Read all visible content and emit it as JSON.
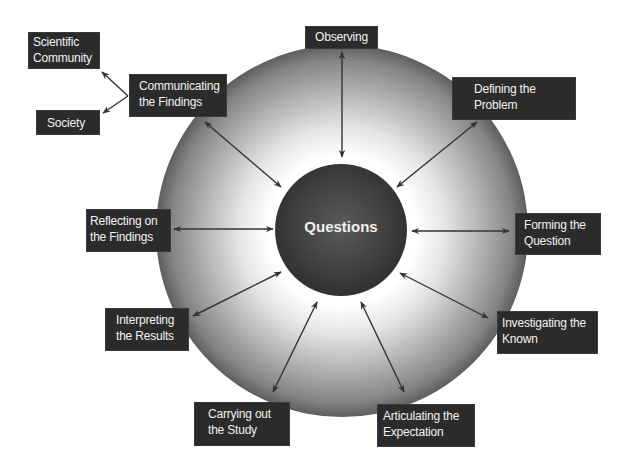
{
  "center": {
    "label": "Questions"
  },
  "nodes": {
    "observing": {
      "line1": "Observing",
      "line2": ""
    },
    "defining": {
      "line1": "Defining the",
      "line2": "Problem"
    },
    "forming": {
      "line1": "Forming the",
      "line2": "Question"
    },
    "investigating": {
      "line1": "Investigating the",
      "line2": "Known"
    },
    "articulating": {
      "line1": "Articulating the",
      "line2": "Expectation"
    },
    "carrying": {
      "line1": "Carrying out",
      "line2": "the Study"
    },
    "interpreting": {
      "line1": "Interpreting",
      "line2": "the Results"
    },
    "reflecting": {
      "line1": "Reflecting on",
      "line2": "the Findings"
    },
    "communicating": {
      "line1": "Communicating",
      "line2": "the Findings"
    },
    "scientific_community": {
      "line1": "Scientific",
      "line2": "Community"
    },
    "society": {
      "line1": "Society",
      "line2": ""
    }
  },
  "colors": {
    "box_fill": "#2b2b2b",
    "box_text": "#f2f2f2",
    "inner_circle": "#3c3c3c",
    "outer_edge": "#5e5e5e",
    "arrow": "#333333"
  }
}
